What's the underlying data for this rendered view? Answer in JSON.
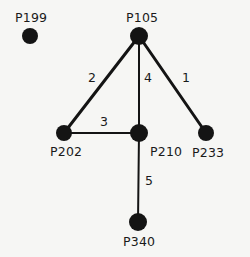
{
  "diagram": {
    "type": "node-link-graph",
    "background_color": "#f6f6f4",
    "node_color": "#141414",
    "edge_color": "#141414",
    "text_color": "#1a1a1a",
    "nodes": [
      {
        "id": "P199",
        "label": "P199",
        "cx": 30,
        "cy": 36,
        "r": 8,
        "label_x": 15,
        "label_y": 12,
        "label_anchor": "start"
      },
      {
        "id": "P105",
        "label": "P105",
        "cx": 139,
        "cy": 36,
        "r": 9,
        "label_x": 139,
        "label_y": 12,
        "label_anchor": "middle"
      },
      {
        "id": "P202",
        "label": "P202",
        "cx": 64,
        "cy": 133,
        "r": 8,
        "label_x": 50,
        "label_y": 146,
        "label_anchor": "start"
      },
      {
        "id": "P210",
        "label": "P210",
        "cx": 139,
        "cy": 133,
        "r": 9,
        "label_x": 150,
        "label_y": 146,
        "label_anchor": "start"
      },
      {
        "id": "P233",
        "label": "P233",
        "cx": 206,
        "cy": 133,
        "r": 8,
        "label_x": 192,
        "label_y": 147,
        "label_anchor": "start"
      },
      {
        "id": "P340",
        "label": "P340",
        "cx": 138,
        "cy": 222,
        "r": 9,
        "label_x": 123,
        "label_y": 236,
        "label_anchor": "start"
      }
    ],
    "edges": [
      {
        "id": "e-p105-p202",
        "from": "P105",
        "to": "P202",
        "weight": "2",
        "x1": 139,
        "y1": 36,
        "x2": 64,
        "y2": 133,
        "width": 3,
        "label_x": 88,
        "label_y": 72
      },
      {
        "id": "e-p105-p210",
        "from": "P105",
        "to": "P210",
        "weight": "4",
        "x1": 139,
        "y1": 36,
        "x2": 139,
        "y2": 133,
        "width": 2,
        "label_x": 144,
        "label_y": 72
      },
      {
        "id": "e-p105-p233",
        "from": "P105",
        "to": "P233",
        "weight": "1",
        "x1": 139,
        "y1": 36,
        "x2": 206,
        "y2": 133,
        "width": 3,
        "label_x": 182,
        "label_y": 72
      },
      {
        "id": "e-p202-p210",
        "from": "P202",
        "to": "P210",
        "weight": "3",
        "x1": 64,
        "y1": 133,
        "x2": 139,
        "y2": 133,
        "width": 2,
        "label_x": 100,
        "label_y": 116
      },
      {
        "id": "e-p210-p340",
        "from": "P210",
        "to": "P340",
        "weight": "5",
        "x1": 139,
        "y1": 133,
        "x2": 138,
        "y2": 222,
        "width": 2,
        "label_x": 145,
        "label_y": 175
      }
    ],
    "isolated_nodes": [
      "P199"
    ]
  }
}
